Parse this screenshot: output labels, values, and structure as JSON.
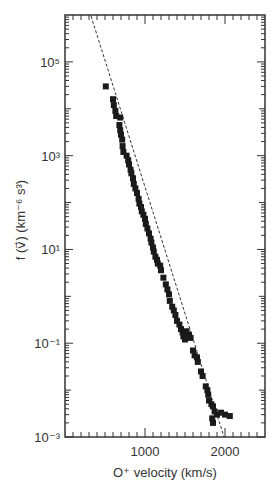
{
  "chart_data": {
    "type": "scatter",
    "title": "",
    "xlabel": "O⁺ velocity (km/s)",
    "ylabel": "f (v⃗) (km⁻⁶ s³)",
    "x_scale": "linear",
    "y_scale": "log",
    "xlim": [
      0,
      2500
    ],
    "ylim": [
      0.001,
      1000000
    ],
    "x_ticks": [
      1000,
      2000
    ],
    "x_tick_labels": [
      "1000",
      "2000"
    ],
    "y_ticks": [
      0.001,
      0.1,
      10,
      1000,
      100000
    ],
    "y_tick_labels": [
      "10⁻³",
      "10⁻¹",
      "10¹",
      "10³",
      "10⁵"
    ],
    "grid": false,
    "legend": null,
    "series": [
      {
        "name": "measured points",
        "marker": "square",
        "points": [
          [
            510,
            30000
          ],
          [
            600,
            16000
          ],
          [
            610,
            12000
          ],
          [
            630,
            9000
          ],
          [
            640,
            7000
          ],
          [
            690,
            6500
          ],
          [
            680,
            4500
          ],
          [
            690,
            3500
          ],
          [
            700,
            2800
          ],
          [
            715,
            2200
          ],
          [
            720,
            1600
          ],
          [
            730,
            1200
          ],
          [
            770,
            1000
          ],
          [
            790,
            800
          ],
          [
            800,
            650
          ],
          [
            820,
            500
          ],
          [
            830,
            420
          ],
          [
            850,
            330
          ],
          [
            860,
            250
          ],
          [
            880,
            200
          ],
          [
            900,
            160
          ],
          [
            920,
            120
          ],
          [
            930,
            95
          ],
          [
            950,
            80
          ],
          [
            960,
            65
          ],
          [
            980,
            55
          ],
          [
            1000,
            45
          ],
          [
            1010,
            35
          ],
          [
            1030,
            28
          ],
          [
            1050,
            22
          ],
          [
            1070,
            17
          ],
          [
            1080,
            14
          ],
          [
            1100,
            11
          ],
          [
            1110,
            9
          ],
          [
            1130,
            7
          ],
          [
            1150,
            6
          ],
          [
            1160,
            5
          ],
          [
            1190,
            4.5
          ],
          [
            1200,
            3.6
          ],
          [
            1230,
            2.5
          ],
          [
            1260,
            1.8
          ],
          [
            1280,
            1.4
          ],
          [
            1300,
            1.1
          ],
          [
            1310,
            0.8
          ],
          [
            1340,
            0.6
          ],
          [
            1360,
            0.5
          ],
          [
            1380,
            0.4
          ],
          [
            1400,
            0.3
          ],
          [
            1430,
            0.25
          ],
          [
            1450,
            0.2
          ],
          [
            1470,
            0.17
          ],
          [
            1480,
            0.14
          ],
          [
            1500,
            0.12
          ],
          [
            1520,
            0.18
          ],
          [
            1550,
            0.15
          ],
          [
            1570,
            0.13
          ],
          [
            1600,
            0.07
          ],
          [
            1620,
            0.055
          ],
          [
            1650,
            0.05
          ],
          [
            1660,
            0.04
          ],
          [
            1700,
            0.025
          ],
          [
            1720,
            0.02
          ],
          [
            1760,
            0.012
          ],
          [
            1780,
            0.01
          ],
          [
            1790,
            0.008
          ],
          [
            1800,
            0.006
          ],
          [
            1830,
            0.005
          ],
          [
            1850,
            0.0045
          ],
          [
            1870,
            0.0035
          ],
          [
            1900,
            0.003
          ],
          [
            1950,
            0.0033
          ],
          [
            2000,
            0.003
          ],
          [
            2060,
            0.0028
          ],
          [
            1840,
            0.0025
          ],
          [
            1850,
            0.002
          ]
        ]
      },
      {
        "name": "fit",
        "line_style": "dashed",
        "points": [
          [
            325,
            950000
          ],
          [
            1988,
            0.001
          ]
        ]
      }
    ]
  }
}
